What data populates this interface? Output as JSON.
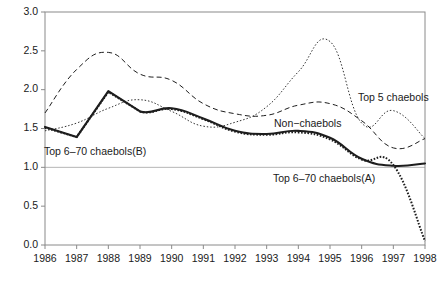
{
  "chart_data": {
    "type": "line",
    "title": "",
    "xlabel": "",
    "ylabel": "",
    "grid": false,
    "legend_position": "inline-annotations",
    "x": [
      1986,
      1987,
      1988,
      1989,
      1990,
      1991,
      1992,
      1993,
      1994,
      1995,
      1996,
      1997,
      1998
    ],
    "categories": [
      "1986",
      "1987",
      "1988",
      "1989",
      "1990",
      "1991",
      "1992",
      "1993",
      "1994",
      "1995",
      "1996",
      "1997",
      "1998"
    ],
    "xlim": [
      1986,
      1998
    ],
    "ylim": [
      0.0,
      3.0
    ],
    "ytick_labels": [
      "0.0",
      "0.5",
      "1.0",
      "1.5",
      "2.0",
      "2.5",
      "3.0"
    ],
    "ytick_values": [
      0.0,
      0.5,
      1.0,
      1.5,
      2.0,
      2.5,
      3.0
    ],
    "reference_line": 1.0,
    "series": [
      {
        "name": "Top 6-70 chaebols(B)",
        "style": "solid-thick",
        "values": [
          1.52,
          1.39,
          1.98,
          1.72,
          1.76,
          1.63,
          1.47,
          1.43,
          1.47,
          1.38,
          1.11,
          1.02,
          1.05
        ]
      },
      {
        "name": "Top 6-70 chaebols(A)",
        "style": "dotted-thick",
        "values": [
          1.51,
          1.39,
          1.97,
          1.72,
          1.75,
          1.62,
          1.46,
          1.42,
          1.45,
          1.36,
          1.1,
          1.03,
          0.05
        ]
      },
      {
        "name": "Non-chaebols",
        "style": "dashed",
        "values": [
          1.7,
          2.26,
          2.48,
          2.2,
          2.12,
          1.82,
          1.69,
          1.67,
          1.8,
          1.82,
          1.6,
          1.25,
          1.37
        ]
      },
      {
        "name": "Top 5 chaebols",
        "style": "dotted-fine",
        "values": [
          1.47,
          1.57,
          1.76,
          1.87,
          1.72,
          1.53,
          1.58,
          1.78,
          2.23,
          2.62,
          1.57,
          1.73,
          1.37
        ]
      }
    ],
    "annotations": [
      {
        "text": "Top 6–70 chaebols(B)",
        "anchor": "start",
        "x_px": 44,
        "y_px": 152
      },
      {
        "text": "Top 6–70 chaebols(A)",
        "anchor": "start",
        "x_px": 273,
        "y_px": 179
      },
      {
        "text": "Non−chaebols",
        "anchor": "start",
        "x_px": 274,
        "y_px": 124
      },
      {
        "text": "Top 5 chaebols",
        "anchor": "start",
        "x_px": 358,
        "y_px": 98
      }
    ],
    "plot_frame_px": {
      "left": 45,
      "right": 425,
      "top": 12,
      "bottom": 245
    }
  }
}
